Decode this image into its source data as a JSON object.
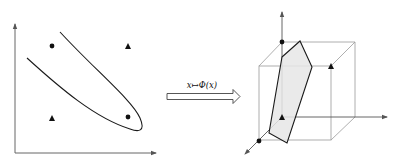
{
  "figure": {
    "left_panel": {
      "name": "input-space",
      "points": [
        {
          "class": "circle",
          "position": "top-left"
        },
        {
          "class": "triangle",
          "position": "top-right"
        },
        {
          "class": "triangle",
          "position": "bottom-left"
        },
        {
          "class": "circle",
          "position": "bottom-right"
        }
      ],
      "boundary": "curved decision boundary enclosing the bottom-right circle"
    },
    "mapping": {
      "label": "x↦Φ(x)"
    },
    "right_panel": {
      "name": "feature-space",
      "shape": "cube",
      "points": [
        {
          "class": "circle",
          "position": "back-top-left"
        },
        {
          "class": "triangle",
          "position": "back-top-right"
        },
        {
          "class": "triangle",
          "position": "origin"
        },
        {
          "class": "circle",
          "position": "front-bottom-left"
        }
      ],
      "separator": "shaded separating plane"
    },
    "colors": {
      "stroke": "#1a1a1a",
      "light_stroke": "#9a9a9a",
      "plane_fill": "#e6e6e6"
    }
  }
}
